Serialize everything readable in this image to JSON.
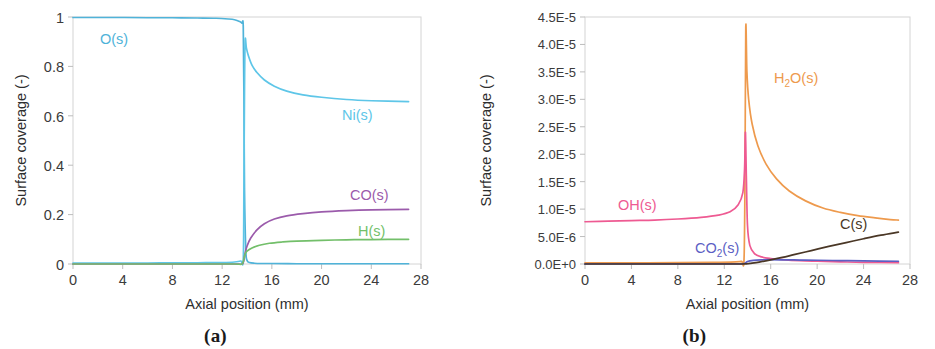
{
  "figure": {
    "panels": [
      {
        "caption": "(a)",
        "xlabel": "Axial position (mm)",
        "ylabel": "Surface coverage (-)",
        "xticks": [
          "0",
          "4",
          "8",
          "12",
          "16",
          "20",
          "24",
          "28"
        ],
        "yticks": [
          "0",
          "0.2",
          "0.4",
          "0.6",
          "0.8",
          "1"
        ],
        "labels": [
          {
            "text": "O(s)",
            "color": "#4fb3d9"
          },
          {
            "text": "Ni(s)",
            "color": "#5ec6e8"
          },
          {
            "text": "CO(s)",
            "color": "#9b5bab"
          },
          {
            "text": "H(s)",
            "color": "#73bf6a"
          }
        ]
      },
      {
        "caption": "(b)",
        "xlabel": "Axial position (mm)",
        "ylabel": "Surface coverage (-)",
        "xticks": [
          "0",
          "4",
          "8",
          "12",
          "16",
          "20",
          "24",
          "28"
        ],
        "yticks": [
          "0.0E+0",
          "5.0E-6",
          "1.0E-5",
          "1.5E-5",
          "2.0E-5",
          "2.5E-5",
          "3.0E-5",
          "3.5E-5",
          "4.0E-5",
          "4.5E-5"
        ],
        "labels": [
          {
            "text": "H2O(s)",
            "color": "#ee9a4d"
          },
          {
            "text": "OH(s)",
            "color": "#ee5a92"
          },
          {
            "text": "CO2(s)",
            "color": "#5c5fc4"
          },
          {
            "text": "C(s)",
            "color": "#4a3726"
          }
        ]
      }
    ]
  },
  "chart_data": [
    {
      "type": "line",
      "panel": "(a)",
      "title": "",
      "xlabel": "Axial position (mm)",
      "ylabel": "Surface coverage (-)",
      "xlim": [
        0,
        28
      ],
      "ylim": [
        0,
        1
      ],
      "xticks": [
        0,
        4,
        8,
        12,
        16,
        20,
        24,
        28
      ],
      "yticks": [
        0,
        0.2,
        0.4,
        0.6,
        0.8,
        1
      ],
      "grid": false,
      "legend": "inline-labels",
      "series": [
        {
          "name": "O(s)",
          "color": "#4fb3d9",
          "x": [
            0,
            2,
            4,
            6,
            8,
            10,
            11.5,
            12.5,
            13.0,
            13.4,
            13.6,
            13.7,
            13.75,
            13.8,
            13.9,
            14.0,
            14.2,
            14.6,
            15.2,
            16,
            18,
            20,
            23,
            27
          ],
          "y": [
            0.998,
            0.998,
            0.998,
            0.997,
            0.997,
            0.996,
            0.995,
            0.992,
            0.989,
            0.982,
            0.975,
            0.96,
            0.7,
            0.3,
            0.06,
            0.015,
            0.006,
            0.003,
            0.002,
            0.002,
            0.001,
            0.001,
            0.001,
            0.001
          ]
        },
        {
          "name": "Ni(s)",
          "color": "#5ec6e8",
          "x": [
            0,
            2,
            4,
            6,
            8,
            10,
            12,
            13.0,
            13.5,
            13.7,
            13.75,
            13.8,
            13.85,
            13.95,
            14.1,
            14.4,
            14.8,
            15.4,
            16.2,
            17.2,
            18.5,
            20,
            22,
            24,
            27
          ],
          "y": [
            0.004,
            0.004,
            0.004,
            0.004,
            0.005,
            0.005,
            0.006,
            0.008,
            0.012,
            0.02,
            0.3,
            0.7,
            0.905,
            0.875,
            0.845,
            0.805,
            0.775,
            0.745,
            0.72,
            0.7,
            0.685,
            0.675,
            0.666,
            0.661,
            0.657
          ]
        },
        {
          "name": "CO(s)",
          "color": "#9b5bab",
          "x": [
            0,
            4,
            8,
            11,
            13,
            13.6,
            13.75,
            13.85,
            14.0,
            14.3,
            14.8,
            15.4,
            16.2,
            17.2,
            18.5,
            20,
            22,
            24,
            27
          ],
          "y": [
            0.0,
            0.0,
            0.0,
            0.0,
            0.0,
            0.0,
            0.015,
            0.045,
            0.072,
            0.105,
            0.138,
            0.163,
            0.182,
            0.195,
            0.204,
            0.211,
            0.216,
            0.219,
            0.221
          ]
        },
        {
          "name": "H(s)",
          "color": "#73bf6a",
          "x": [
            0,
            4,
            8,
            11,
            13,
            13.6,
            13.75,
            13.85,
            14.0,
            14.4,
            15.0,
            15.8,
            16.8,
            18,
            20,
            22,
            24,
            27
          ],
          "y": [
            0.0,
            0.0,
            0.0,
            0.0,
            0.0,
            0.0,
            0.02,
            0.04,
            0.052,
            0.065,
            0.076,
            0.084,
            0.089,
            0.093,
            0.096,
            0.098,
            0.099,
            0.1
          ]
        }
      ]
    },
    {
      "type": "line",
      "panel": "(b)",
      "title": "",
      "xlabel": "Axial position (mm)",
      "ylabel": "Surface coverage (-)",
      "xlim": [
        0,
        28
      ],
      "ylim": [
        0,
        4.5e-05
      ],
      "xticks": [
        0,
        4,
        8,
        12,
        16,
        20,
        24,
        28
      ],
      "yticks": [
        0,
        5e-06,
        1e-05,
        1.5e-05,
        2e-05,
        2.5e-05,
        3e-05,
        3.5e-05,
        4e-05,
        4.5e-05
      ],
      "grid": false,
      "legend": "inline-labels",
      "series": [
        {
          "name": "H2O(s)",
          "color": "#ee9a4d",
          "x": [
            0,
            4,
            8,
            11,
            13,
            13.5,
            13.7,
            13.78,
            13.85,
            13.95,
            14.1,
            14.4,
            14.9,
            15.6,
            16.5,
            17.6,
            19,
            20.5,
            22,
            23.5,
            25,
            26.3,
            27
          ],
          "y": [
            2e-07,
            2e-07,
            2.5e-07,
            3e-07,
            4e-07,
            5e-07,
            8e-07,
            1.5e-05,
            4.3e-05,
            3.5e-05,
            3e-05,
            2.55e-05,
            2.15e-05,
            1.82e-05,
            1.55e-05,
            1.33e-05,
            1.15e-05,
            1.02e-05,
            9.4e-06,
            8.8e-06,
            8.4e-06,
            8.1e-06,
            8e-06
          ]
        },
        {
          "name": "OH(s)",
          "color": "#ee5a92",
          "x": [
            0,
            2,
            4,
            6,
            8,
            10,
            11.5,
            12.5,
            13.2,
            13.6,
            13.75,
            13.82,
            13.9,
            14.0,
            14.2,
            14.6,
            15.2,
            16,
            17,
            18.5,
            20,
            22,
            24,
            27
          ],
          "y": [
            7.7e-06,
            7.8e-06,
            7.9e-06,
            8e-06,
            8.2e-06,
            8.5e-06,
            8.9e-06,
            9.5e-06,
            1.08e-05,
            1.3e-05,
            1.75e-05,
            2.4e-05,
            1.6e-05,
            7e-06,
            3.4e-06,
            1.9e-06,
            1.3e-06,
            1e-06,
            8e-07,
            6e-07,
            5e-07,
            4e-07,
            3e-07,
            2.5e-07
          ]
        },
        {
          "name": "CO2(s)",
          "color": "#5c5fc4",
          "x": [
            0,
            4,
            8,
            11,
            13,
            13.6,
            13.8,
            14.0,
            14.5,
            15.2,
            16,
            17,
            18.5,
            20,
            22,
            24,
            27
          ],
          "y": [
            1e-08,
            1e-08,
            1e-08,
            1e-08,
            2e-08,
            3e-08,
            1.5e-07,
            4.5e-07,
            6.5e-07,
            7.5e-07,
            7.8e-07,
            7.6e-07,
            7.2e-07,
            6.8e-07,
            6.2e-07,
            5.6e-07,
            5e-07
          ]
        },
        {
          "name": "C(s)",
          "color": "#4a3726",
          "x": [
            0,
            4,
            8,
            11,
            13,
            13.8,
            14.2,
            15,
            16,
            17,
            18,
            19.5,
            21,
            22.5,
            24,
            25.5,
            27
          ],
          "y": [
            0,
            0,
            0,
            0,
            0,
            1e-08,
            1.2e-07,
            3.5e-07,
            7.5e-07,
            1.2e-06,
            1.7e-06,
            2.45e-06,
            3.2e-06,
            3.9e-06,
            4.6e-06,
            5.25e-06,
            5.8e-06
          ]
        }
      ]
    }
  ]
}
